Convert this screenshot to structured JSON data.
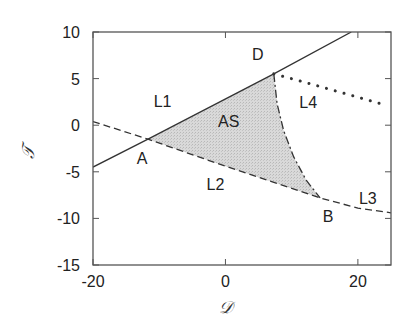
{
  "chart_data": {
    "type": "line",
    "title": "",
    "xlabel": "𝒟",
    "ylabel": "𝒯",
    "xlim": [
      -20,
      25
    ],
    "ylim": [
      -15,
      10
    ],
    "grid": false,
    "legend": null,
    "xticks": [
      -20,
      0,
      20
    ],
    "xtick_labels": [
      "-20",
      "0",
      "20"
    ],
    "yticks": [
      10,
      5,
      0,
      -5,
      -10,
      -15
    ],
    "ytick_labels": [
      "10",
      "5",
      "0",
      "-5",
      "-10",
      "-15"
    ],
    "series": [
      {
        "name": "L1 boundary (solid)",
        "style": "solid",
        "points": [
          [
            -20,
            -4.5
          ],
          [
            -11.7,
            -1.5
          ],
          [
            7.3,
            5.5
          ],
          [
            19.0,
            10.0
          ]
        ]
      },
      {
        "name": "L2 boundary (dashed)",
        "style": "dashed",
        "points": [
          [
            -20,
            0.4
          ],
          [
            -11.7,
            -1.5
          ],
          [
            0,
            -4.4
          ],
          [
            14.3,
            -7.8
          ],
          [
            20,
            -8.9
          ],
          [
            25,
            -9.4
          ]
        ]
      },
      {
        "name": "AS/L4 boundary (dash-dot)",
        "style": "dashdot",
        "points": [
          [
            7.3,
            5.5
          ],
          [
            7.8,
            2.3
          ],
          [
            8.8,
            -0.6
          ],
          [
            10.3,
            -3.4
          ],
          [
            12.2,
            -5.9
          ],
          [
            14.3,
            -7.8
          ]
        ]
      },
      {
        "name": "L4 boundary (dotted)",
        "style": "dotted",
        "points": [
          [
            7.3,
            5.5
          ],
          [
            12,
            4.6
          ],
          [
            17,
            3.6
          ],
          [
            21,
            2.8
          ],
          [
            23.5,
            2.3
          ]
        ]
      }
    ],
    "shaded_region": {
      "name": "AS",
      "fill": "#d4d4d4",
      "vertices_ref": [
        "A",
        "D",
        "B"
      ]
    },
    "points": [
      {
        "label": "A",
        "x": -11.7,
        "y": -1.5
      },
      {
        "label": "B",
        "x": 14.3,
        "y": -7.8
      },
      {
        "label": "D",
        "x": 7.3,
        "y": 5.5
      }
    ],
    "annotations": [
      {
        "text": "L1",
        "x": -9.5,
        "y": 2.0
      },
      {
        "text": "AS",
        "x": 0.5,
        "y": -0.2
      },
      {
        "text": "L2",
        "x": -1.5,
        "y": -7.0
      },
      {
        "text": "L4",
        "x": 12.5,
        "y": 1.8
      },
      {
        "text": "L3",
        "x": 21.5,
        "y": -8.5
      },
      {
        "text": "A",
        "x": -12.6,
        "y": -4.2
      },
      {
        "text": "B",
        "x": 15.5,
        "y": -10.4
      },
      {
        "text": "D",
        "x": 4.9,
        "y": 7.0
      }
    ]
  },
  "colors": {
    "axis": "#555555",
    "line": "#333333",
    "fill": "#d4d4d4",
    "text": "#222222"
  }
}
